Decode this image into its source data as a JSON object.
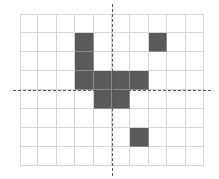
{
  "grid": {
    "columns": 10,
    "rows": 8,
    "cell_width": 18.4,
    "cell_height": 19,
    "line_color": "#d6d6d6",
    "fill_color": "#5a5a5a",
    "filled_cells": [
      [
        3,
        1
      ],
      [
        7,
        1
      ],
      [
        3,
        2
      ],
      [
        3,
        3
      ],
      [
        4,
        3
      ],
      [
        5,
        3
      ],
      [
        6,
        3
      ],
      [
        4,
        4
      ],
      [
        5,
        4
      ],
      [
        6,
        6
      ]
    ]
  },
  "axes": {
    "horizontal": {
      "style": "dashed",
      "y": 90
    },
    "vertical": {
      "style": "dashed",
      "x": 112
    }
  }
}
